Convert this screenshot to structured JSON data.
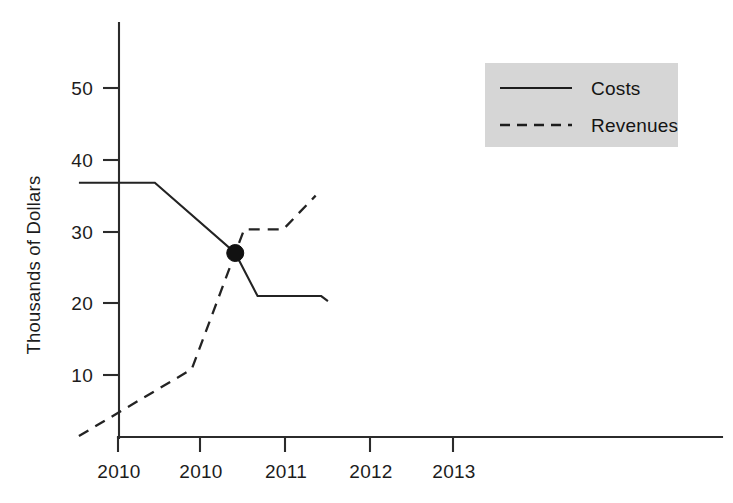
{
  "chart_data": {
    "type": "line",
    "title": "",
    "subtitle": "",
    "xlabel": "",
    "ylabel": "Thousands of Dollars",
    "x_tick_labels": [
      "2010",
      "2010",
      "2011",
      "2012",
      "2013"
    ],
    "y_tick_labels": [
      "10",
      "20",
      "30",
      "40",
      "50"
    ],
    "y_tick_values": [
      10,
      20,
      30,
      40,
      50
    ],
    "xlim": [
      2009.6,
      2013.8
    ],
    "ylim": [
      0,
      57
    ],
    "grid": false,
    "legend_position": "top-right",
    "legend_background": "#d6d6d6",
    "series": [
      {
        "name": "Costs",
        "line_style": "solid",
        "color": "#232323",
        "points": [
          {
            "x": 2009.65,
            "y": 36.8
          },
          {
            "x": 2010.33,
            "y": 36.8
          },
          {
            "x": 2011.05,
            "y": 27.0
          },
          {
            "x": 2011.25,
            "y": 21.0
          },
          {
            "x": 2011.82,
            "y": 21.0
          },
          {
            "x": 2011.88,
            "y": 20.3
          }
        ]
      },
      {
        "name": "Revenues",
        "line_style": "dashed",
        "color": "#232323",
        "points": [
          {
            "x": 2009.65,
            "y": 1.5
          },
          {
            "x": 2010.66,
            "y": 10.8
          },
          {
            "x": 2011.05,
            "y": 27.0
          },
          {
            "x": 2011.13,
            "y": 30.3
          },
          {
            "x": 2011.48,
            "y": 30.3
          },
          {
            "x": 2011.77,
            "y": 35.0
          }
        ]
      }
    ],
    "annotations": [
      {
        "name": "break-even-point",
        "type": "point-marker",
        "x": 2011.05,
        "y": 27.0,
        "color": "#111111"
      }
    ]
  },
  "legend": {
    "items": [
      {
        "label": "Costs",
        "style": "solid"
      },
      {
        "label": "Revenues",
        "style": "dashed"
      }
    ]
  },
  "axes": {
    "y_axis_title": "Thousands of Dollars"
  }
}
